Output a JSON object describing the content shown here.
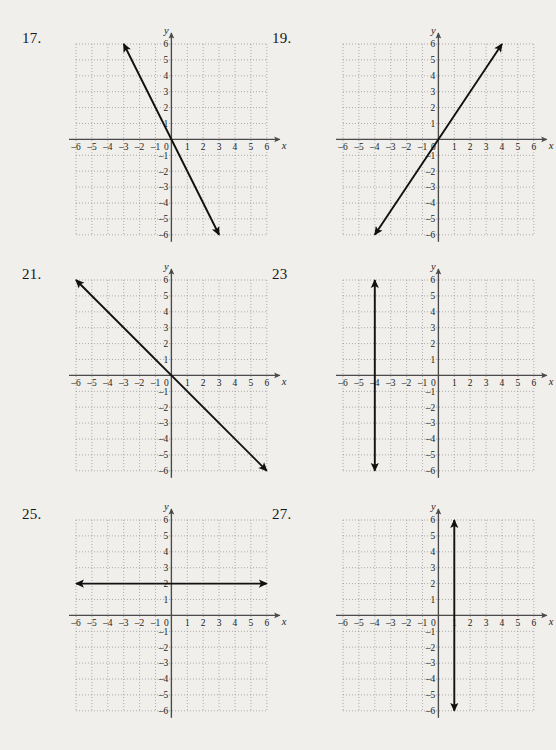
{
  "page": {
    "background_color": "#f1efec",
    "ink_color": "#1d1f22",
    "grid_color": "#8d8d8d",
    "axis_color": "#4a4a4a",
    "line_color": "#111111",
    "width": 534,
    "height": 750
  },
  "axes": {
    "x_label": "x",
    "y_label": "y",
    "x_min": -6,
    "x_max": 6,
    "y_min": -6,
    "y_max": 6,
    "x_ticks": [
      "-6",
      "-5",
      "-4",
      "-3",
      "-2",
      "-1",
      "0",
      "1",
      "2",
      "3",
      "4",
      "5",
      "6"
    ],
    "y_ticks": [
      "6",
      "5",
      "4",
      "3",
      "2",
      "1",
      "-1",
      "-2",
      "-3",
      "-4",
      "-5",
      "-6"
    ],
    "origin_label": "0",
    "grid_style": "dotted",
    "unit_step": 1
  },
  "problems": [
    {
      "id": "p17",
      "number": "17.",
      "col": 0,
      "row": 0,
      "chart_data": {
        "type": "line",
        "title": "17.",
        "xlabel": "x",
        "ylabel": "y",
        "xlim": [
          -6,
          6
        ],
        "ylim": [
          -6,
          6
        ],
        "grid": true,
        "legend": "none",
        "series": [
          {
            "name": "line-17",
            "kind": "linear",
            "slope": -2,
            "intercept": 0,
            "equation": "y = -2x",
            "x": [
              -3,
              3
            ],
            "values": [
              6,
              -6
            ],
            "arrow_start": true,
            "arrow_end": true
          }
        ]
      }
    },
    {
      "id": "p19",
      "number": "19.",
      "col": 1,
      "row": 0,
      "chart_data": {
        "type": "line",
        "title": "19.",
        "xlabel": "x",
        "ylabel": "y",
        "xlim": [
          -6,
          6
        ],
        "ylim": [
          -6,
          6
        ],
        "grid": true,
        "legend": "none",
        "series": [
          {
            "name": "line-19",
            "kind": "linear",
            "slope": 1.5,
            "intercept": 0,
            "equation": "y = 3/2 x",
            "x": [
              -4,
              4
            ],
            "values": [
              -6,
              6
            ],
            "arrow_start": true,
            "arrow_end": true
          }
        ]
      }
    },
    {
      "id": "p21",
      "number": "21.",
      "col": 0,
      "row": 1,
      "chart_data": {
        "type": "line",
        "title": "21.",
        "xlabel": "x",
        "ylabel": "y",
        "xlim": [
          -6,
          6
        ],
        "ylim": [
          -6,
          6
        ],
        "grid": true,
        "legend": "none",
        "series": [
          {
            "name": "line-21",
            "kind": "linear",
            "slope": -1,
            "intercept": 0,
            "equation": "y = -x",
            "x": [
              -6,
              6
            ],
            "values": [
              6,
              -6
            ],
            "arrow_start": true,
            "arrow_end": true
          }
        ]
      }
    },
    {
      "id": "p23",
      "number": "23",
      "col": 1,
      "row": 1,
      "chart_data": {
        "type": "line",
        "title": "23",
        "xlabel": "x",
        "ylabel": "y",
        "xlim": [
          -6,
          6
        ],
        "ylim": [
          -6,
          6
        ],
        "grid": true,
        "legend": "none",
        "series": [
          {
            "name": "line-23",
            "kind": "vertical",
            "equation": "x = -4",
            "x": [
              -4,
              -4
            ],
            "values": [
              -6,
              6
            ],
            "arrow_start": true,
            "arrow_end": true
          }
        ]
      }
    },
    {
      "id": "p25",
      "number": "25.",
      "col": 0,
      "row": 2,
      "chart_data": {
        "type": "line",
        "title": "25.",
        "xlabel": "x",
        "ylabel": "y",
        "xlim": [
          -6,
          6
        ],
        "ylim": [
          -6,
          6
        ],
        "grid": true,
        "legend": "none",
        "series": [
          {
            "name": "line-25",
            "kind": "horizontal",
            "equation": "y = 2",
            "x": [
              -6,
              6
            ],
            "values": [
              2,
              2
            ],
            "arrow_start": true,
            "arrow_end": true
          }
        ]
      }
    },
    {
      "id": "p27",
      "number": "27.",
      "col": 1,
      "row": 2,
      "chart_data": {
        "type": "line",
        "title": "27.",
        "xlabel": "x",
        "ylabel": "y",
        "xlim": [
          -6,
          6
        ],
        "ylim": [
          -6,
          6
        ],
        "grid": true,
        "legend": "none",
        "series": [
          {
            "name": "line-27",
            "kind": "vertical",
            "equation": "x = 1",
            "x": [
              1,
              1
            ],
            "values": [
              -6,
              6
            ],
            "arrow_start": true,
            "arrow_end": true
          }
        ]
      }
    }
  ]
}
